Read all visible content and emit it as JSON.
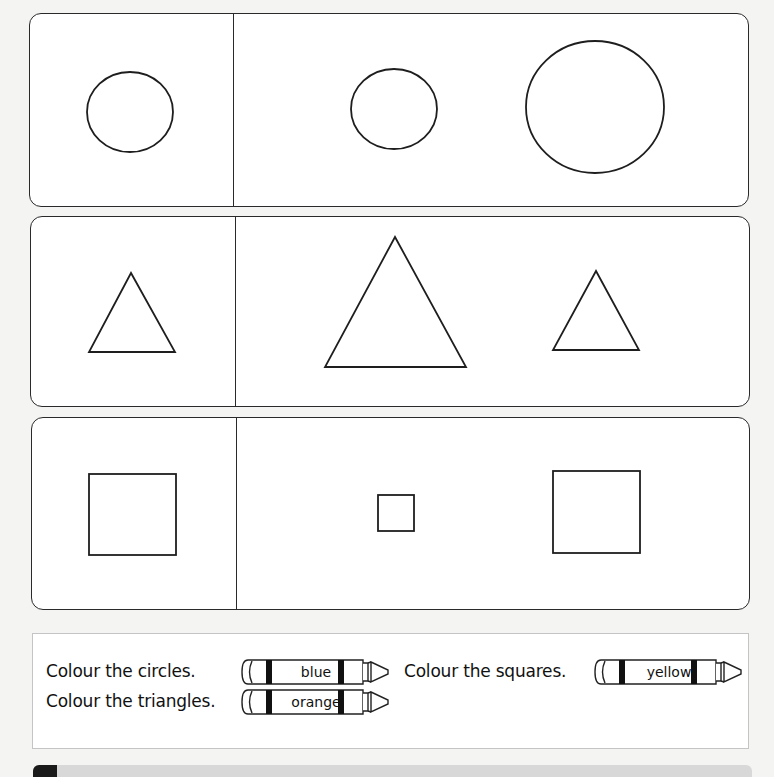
{
  "worksheet": {
    "rows": [
      {
        "shape": "circle",
        "example": {
          "cx": 130,
          "cy": 112,
          "rx": 43,
          "ry": 40
        },
        "items": [
          {
            "cx": 394,
            "cy": 109,
            "rx": 43,
            "ry": 40
          },
          {
            "cx": 595,
            "cy": 107,
            "rx": 69,
            "ry": 66
          }
        ]
      },
      {
        "shape": "triangle",
        "example": {
          "points": "131,273 89,352 175,352"
        },
        "items": [
          {
            "points": "395,237 325,367 466,367"
          },
          {
            "points": "596,271 553,350 639,350"
          }
        ]
      },
      {
        "shape": "square",
        "example": {
          "x": 89,
          "y": 474,
          "w": 87,
          "h": 81
        },
        "items": [
          {
            "x": 378,
            "y": 495,
            "w": 36,
            "h": 36
          },
          {
            "x": 553,
            "y": 471,
            "w": 87,
            "h": 82
          }
        ]
      }
    ]
  },
  "instructions": {
    "circles": {
      "text": "Colour the circles.",
      "crayon": "blue",
      "color": "#1e5bd6"
    },
    "squares": {
      "text": "Colour the squares.",
      "crayon": "yellow",
      "color": "#f5d000"
    },
    "triangles": {
      "text": "Colour the triangles.",
      "crayon": "orange",
      "color": "#f28a00"
    }
  }
}
